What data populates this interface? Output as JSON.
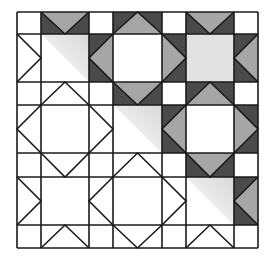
{
  "diagram": {
    "title": "Quilt block pattern (flying geese star grid)",
    "colors": {
      "background": "#ffffff",
      "line": "#1a1a1a",
      "dark": "#4a4a4a",
      "medium": "#a6a6a6",
      "light": "#e2e2e2"
    },
    "col_edges": [
      17,
      41,
      89,
      113,
      162,
      186,
      234,
      258
    ],
    "row_edges": [
      12,
      34,
      82,
      105,
      153,
      177,
      225,
      248
    ],
    "geese": [
      {
        "row": 0,
        "col": 1,
        "apex": "down",
        "shaded": true
      },
      {
        "row": 0,
        "col": 3,
        "apex": "up",
        "shaded": true
      },
      {
        "row": 0,
        "col": 5,
        "apex": "down",
        "shaded": true
      },
      {
        "row": 2,
        "col": 1,
        "apex": "up",
        "shaded": false
      },
      {
        "row": 2,
        "col": 3,
        "apex": "down",
        "shaded": true
      },
      {
        "row": 2,
        "col": 5,
        "apex": "up",
        "shaded": true
      },
      {
        "row": 4,
        "col": 1,
        "apex": "down",
        "shaded": false
      },
      {
        "row": 4,
        "col": 3,
        "apex": "up",
        "shaded": false
      },
      {
        "row": 4,
        "col": 5,
        "apex": "down",
        "shaded": true
      },
      {
        "row": 6,
        "col": 1,
        "apex": "up",
        "shaded": false
      },
      {
        "row": 6,
        "col": 3,
        "apex": "down",
        "shaded": false
      },
      {
        "row": 6,
        "col": 5,
        "apex": "up",
        "shaded": false
      },
      {
        "row": 1,
        "col": 0,
        "apex": "right",
        "shaded": false
      },
      {
        "row": 3,
        "col": 0,
        "apex": "left",
        "shaded": false
      },
      {
        "row": 5,
        "col": 0,
        "apex": "right",
        "shaded": false
      },
      {
        "row": 1,
        "col": 2,
        "apex": "left",
        "shaded": true
      },
      {
        "row": 3,
        "col": 2,
        "apex": "right",
        "shaded": false
      },
      {
        "row": 5,
        "col": 2,
        "apex": "left",
        "shaded": false
      },
      {
        "row": 1,
        "col": 4,
        "apex": "right",
        "shaded": true
      },
      {
        "row": 3,
        "col": 4,
        "apex": "left",
        "shaded": true
      },
      {
        "row": 5,
        "col": 4,
        "apex": "right",
        "shaded": false
      },
      {
        "row": 1,
        "col": 6,
        "apex": "left",
        "shaded": true
      },
      {
        "row": 3,
        "col": 6,
        "apex": "right",
        "shaded": true
      },
      {
        "row": 5,
        "col": 6,
        "apex": "left",
        "shaded": true
      }
    ],
    "centers": [
      {
        "row": 1,
        "col": 1,
        "fill": "diagonal"
      },
      {
        "row": 1,
        "col": 3,
        "fill": "none"
      },
      {
        "row": 1,
        "col": 5,
        "fill": "full"
      },
      {
        "row": 3,
        "col": 1,
        "fill": "none"
      },
      {
        "row": 3,
        "col": 3,
        "fill": "diagonal"
      },
      {
        "row": 3,
        "col": 5,
        "fill": "none"
      },
      {
        "row": 5,
        "col": 1,
        "fill": "none"
      },
      {
        "row": 5,
        "col": 3,
        "fill": "none"
      },
      {
        "row": 5,
        "col": 5,
        "fill": "diagonal"
      }
    ]
  }
}
